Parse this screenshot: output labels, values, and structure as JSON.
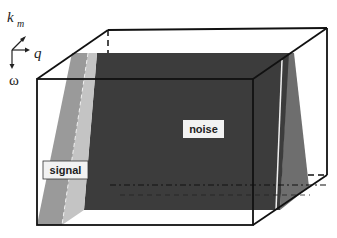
{
  "diagram": {
    "type": "3d-cube-schematic",
    "axes": {
      "km": {
        "label": "k",
        "subscript": "m"
      },
      "q": {
        "label": "q"
      },
      "omega": {
        "label": "ω"
      }
    },
    "regions": {
      "signal": {
        "label": "signal",
        "color": "#9a9a9a"
      },
      "noise": {
        "label": "noise",
        "color": "#3c3c3c"
      },
      "signal_light": {
        "color": "#c4c4c4"
      },
      "noise_side": {
        "color": "#6e6e6e"
      }
    },
    "colors": {
      "edge": "#111111",
      "background": "#ffffff",
      "label_box": "#f2f2f2"
    }
  }
}
